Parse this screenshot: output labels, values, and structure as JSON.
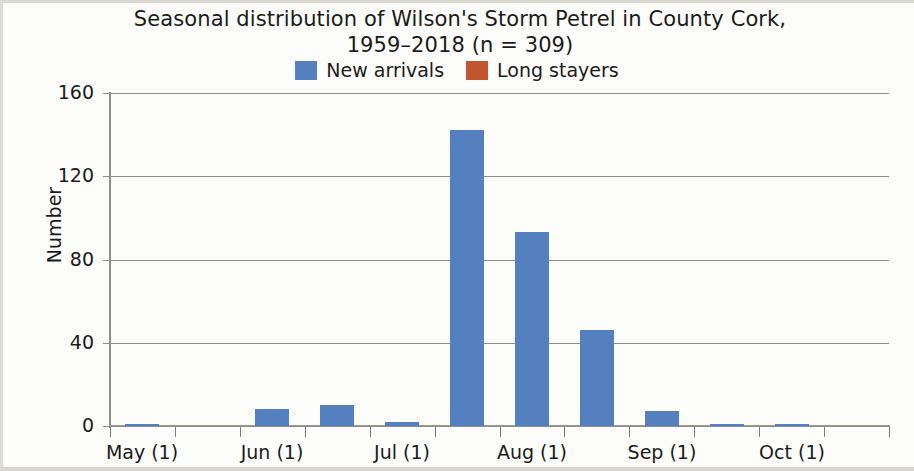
{
  "figure": {
    "title_line1": "Seasonal distribution of Wilson's Storm Petrel in County Cork,",
    "title_line2": "1959–2018 (n = 309)"
  },
  "legend": {
    "items": [
      {
        "label": "New arrivals",
        "color": "#5580c0",
        "swatch_name": "legend-swatch-new-arrivals"
      },
      {
        "label": "Long stayers",
        "color": "#c0552f",
        "swatch_name": "legend-swatch-long-stayers"
      }
    ]
  },
  "axes": {
    "y_title": "Number",
    "y_ticks": [
      "160",
      "120",
      "80",
      "40",
      "0"
    ],
    "x_ticks": [
      "May (1)",
      "Jun (1)",
      "Jul (1)",
      "Aug (1)",
      "Sep (1)",
      "Oct (1)"
    ]
  },
  "chart_data": {
    "type": "bar",
    "title": "Seasonal distribution of Wilson's Storm Petrel in County Cork, 1959–2018 (n = 309)",
    "xlabel": "",
    "ylabel": "Number",
    "ylim": [
      0,
      160
    ],
    "yticks": [
      0,
      40,
      80,
      120,
      160
    ],
    "grid": "horizontal",
    "legend_position": "top-center",
    "categories": [
      "May (1)",
      "May (2)",
      "Jun (1)",
      "Jun (2)",
      "Jul (1)",
      "Jul (2)",
      "Aug (1)",
      "Aug (2)",
      "Sep (1)",
      "Sep (2)",
      "Oct (1)",
      "Oct (2)"
    ],
    "series": [
      {
        "name": "New arrivals",
        "color": "#5580c0",
        "values": [
          1,
          0,
          8,
          10,
          2,
          142,
          93,
          46,
          7,
          1,
          1,
          0
        ]
      },
      {
        "name": "Long stayers",
        "color": "#c0552f",
        "values": [
          0,
          0,
          0,
          0,
          0,
          0,
          0,
          0,
          0,
          0,
          0,
          0
        ]
      }
    ]
  }
}
